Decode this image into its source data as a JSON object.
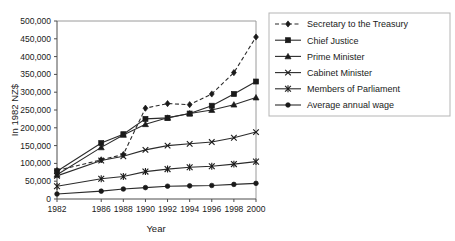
{
  "chart_data": {
    "type": "line",
    "title": "",
    "xlabel": "Year",
    "ylabel": "In 1982 NZ$",
    "x": [
      1982,
      1986,
      1988,
      1990,
      1992,
      1994,
      1996,
      1998,
      2000
    ],
    "xtick_labels": [
      "1982",
      "1986",
      "1988",
      "1990",
      "1992",
      "1994",
      "1996",
      "1998",
      "2000"
    ],
    "ytick_labels": [
      "0",
      "50,000",
      "100,000",
      "150,000",
      "200,000",
      "250,000",
      "300,000",
      "350,000",
      "400,000",
      "450,000",
      "500,000"
    ],
    "ytick_values": [
      0,
      50000,
      100000,
      150000,
      200000,
      250000,
      300000,
      350000,
      400000,
      450000,
      500000
    ],
    "xlim": [
      1981,
      2001
    ],
    "ylim": [
      0,
      500000
    ],
    "grid": false,
    "legend_position": "right",
    "series": [
      {
        "name": "Secretary to the Treasury",
        "marker": "diamond",
        "dashed": true,
        "values": [
          80000,
          110000,
          125000,
          255000,
          268000,
          265000,
          295000,
          355000,
          455000
        ]
      },
      {
        "name": "Chief Justice",
        "marker": "square",
        "dashed": false,
        "values": [
          78000,
          157000,
          182000,
          225000,
          228000,
          240000,
          262000,
          295000,
          330000
        ]
      },
      {
        "name": "Prime Minister",
        "marker": "triangle",
        "dashed": false,
        "values": [
          68000,
          145000,
          180000,
          210000,
          228000,
          240000,
          250000,
          265000,
          285000
        ]
      },
      {
        "name": "Cabinet Minister",
        "marker": "cross",
        "dashed": false,
        "values": [
          65000,
          108000,
          120000,
          138000,
          150000,
          155000,
          160000,
          172000,
          188000
        ]
      },
      {
        "name": "Members of Parliament",
        "marker": "star",
        "dashed": false,
        "values": [
          36000,
          57000,
          63000,
          77000,
          84000,
          89000,
          92000,
          98000,
          105000
        ]
      },
      {
        "name": "Average annual wage",
        "marker": "circle",
        "dashed": false,
        "values": [
          14000,
          22000,
          28000,
          32000,
          36000,
          37000,
          38000,
          41000,
          44000
        ]
      }
    ]
  },
  "legend": {
    "items": [
      {
        "label": "Secretary to the Treasury"
      },
      {
        "label": "Chief Justice"
      },
      {
        "label": "Prime Minister"
      },
      {
        "label": "Cabinet Minister"
      },
      {
        "label": "Members of Parliament"
      },
      {
        "label": "Average annual wage"
      }
    ]
  }
}
